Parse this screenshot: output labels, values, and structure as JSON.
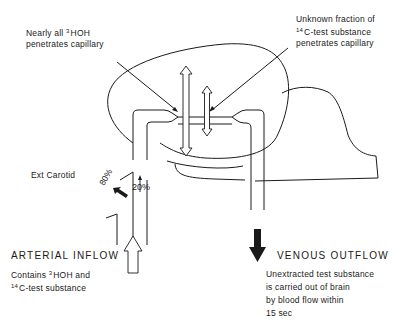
{
  "annotations": {
    "hoh": {
      "prefix_line1": "Nearly all ",
      "isotope": "3",
      "compound": "HOH",
      "line2": "penetrates capillary"
    },
    "c14": {
      "line1": "Unknown fraction of",
      "isotope": "14",
      "compound": "C-test substance",
      "line3": "penetrates capillary"
    },
    "ext_carotid": "Ext Carotid",
    "pct_brain": "20%",
    "pct_ext": "80%"
  },
  "arterial": {
    "heading": "ARTERIAL INFLOW",
    "line1_prefix": "Contains ",
    "isotope_h": "3",
    "line1_compound": "HOH and",
    "isotope_c": "14",
    "line2": "C-test substance"
  },
  "venous": {
    "heading": "VENOUS OUTFLOW",
    "lines": [
      "Unextracted test substance",
      "is carried out of brain",
      "by blood flow within",
      "15 sec"
    ]
  },
  "colors": {
    "line": "#1a1a1a",
    "background": "#ffffff"
  }
}
